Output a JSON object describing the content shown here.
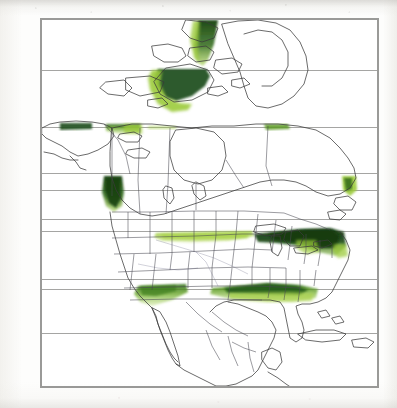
{
  "figure": {
    "type": "distribution-map",
    "region": "North America",
    "caption": "",
    "frame": {
      "x": 41,
      "y": 19,
      "width": 337,
      "height": 368,
      "border_color": "#9a9a98"
    }
  },
  "chart_data": {
    "type": "map",
    "title": "",
    "subtitle": "",
    "xlabel": "",
    "ylabel": "",
    "projection": "conic",
    "grid": true,
    "legend_position": "none",
    "colors": {
      "shade_dark": "#1d4d1a",
      "shade_mid": "#4a7f20",
      "shade_light": "#9ccb3b",
      "coastline": "#3a3a3a",
      "border_line": "#4a4a52",
      "graticule": "#8e8e8c",
      "frame": "#9a9a98",
      "background": "#ffffff"
    },
    "graticule_lines": [
      {
        "label": "",
        "y": 70
      },
      {
        "label": "",
        "y": 127
      },
      {
        "label": "",
        "y": 173
      },
      {
        "label": "",
        "y": 190
      },
      {
        "label": "",
        "y": 219
      },
      {
        "label": "",
        "y": 231
      },
      {
        "label": "",
        "y": 279
      },
      {
        "label": "",
        "y": 289
      },
      {
        "label": "",
        "y": 333
      }
    ],
    "shaded_regions": [
      {
        "name": "baffin-island-north",
        "intensity": "dark"
      },
      {
        "name": "baffin-island-south",
        "intensity": "dark"
      },
      {
        "name": "hudson-strait-coast",
        "intensity": "light"
      },
      {
        "name": "alaska-north-slope",
        "intensity": "dark"
      },
      {
        "name": "yukon-mackenzie",
        "intensity": "mid"
      },
      {
        "name": "hudson-bay-west-coast",
        "intensity": "light"
      },
      {
        "name": "labrador-coast",
        "intensity": "mid"
      },
      {
        "name": "british-columbia-coast",
        "intensity": "dark"
      },
      {
        "name": "northern-plains-band",
        "intensity": "light"
      },
      {
        "name": "great-lakes-northeast",
        "intensity": "dark"
      },
      {
        "name": "atlantic-mid-coast",
        "intensity": "dark"
      },
      {
        "name": "southwest-california-arizona",
        "intensity": "mid"
      },
      {
        "name": "gulf-coast-band",
        "intensity": "mid"
      }
    ]
  }
}
